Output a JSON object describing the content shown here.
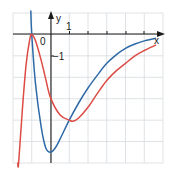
{
  "chart_data": {
    "type": "line",
    "title": "",
    "xlabel": "x",
    "ylabel": "y",
    "xlim": [
      -2,
      6
    ],
    "ylim": [
      -6,
      1
    ],
    "grid": true,
    "tick_labels": {
      "origin": "0",
      "x_one": "1",
      "y_minus_one": "−1"
    },
    "series": [
      {
        "name": "blue-curve",
        "color": "#2f6aa8",
        "x": [
          -1.0,
          -0.8,
          -0.5,
          -0.25,
          0,
          0.25,
          0.5,
          1.0,
          1.5,
          2.0,
          2.5,
          3.0,
          3.5,
          4.0,
          4.5,
          5.0,
          5.6
        ],
        "y": [
          0.0,
          -2.3,
          -4.3,
          -5.3,
          -5.5,
          -5.3,
          -4.9,
          -4.0,
          -3.2,
          -2.5,
          -1.9,
          -1.35,
          -0.95,
          -0.65,
          -0.45,
          -0.3,
          -0.18
        ]
      },
      {
        "name": "red-curve",
        "color": "#dd4b45",
        "x": [
          -1.7,
          -1.5,
          -1.3,
          -1.1,
          -1.0,
          -0.8,
          -0.5,
          -0.25,
          0,
          0.5,
          1.0,
          1.2,
          1.5,
          2.0,
          2.5,
          3.0,
          3.5,
          4.0,
          4.5,
          5.0,
          5.6
        ],
        "y": [
          -6.0,
          -3.5,
          -1.4,
          -0.2,
          0.0,
          -0.3,
          -1.2,
          -2.1,
          -2.95,
          -3.75,
          -4.0,
          -4.05,
          -3.9,
          -3.4,
          -2.75,
          -2.15,
          -1.7,
          -1.35,
          -1.0,
          -0.75,
          -0.5
        ]
      }
    ]
  },
  "axes": {
    "x_label": "x",
    "y_label": "y",
    "origin_label": "0",
    "x_tick_1_label": "1",
    "y_tick_minus1_label": "−1"
  },
  "colors": {
    "grid": "#d6dbe0",
    "axis": "#1a1a1a",
    "blue": "#2f6aa8",
    "red": "#dd4b45"
  }
}
